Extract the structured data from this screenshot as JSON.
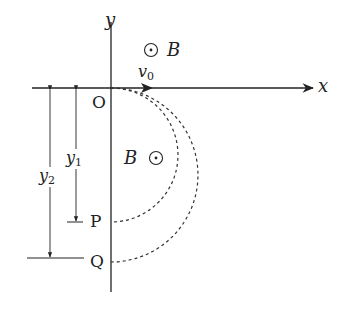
{
  "diagram": {
    "axes": {
      "x_label": "x",
      "y_label": "y",
      "origin_label": "O"
    },
    "velocity": {
      "label": "v",
      "subscript": "0"
    },
    "field": {
      "upper_label": "B",
      "lower_label": "B",
      "direction_symbol": "out-of-page (dot in circle)"
    },
    "points": {
      "p_label": "P",
      "q_label": "Q"
    },
    "dimensions": {
      "y1_label": "y",
      "y1_subscript": "1",
      "y2_label": "y",
      "y2_subscript": "2"
    },
    "trajectories": [
      {
        "name": "inner",
        "from": "O",
        "to": "P",
        "style": "dashed"
      },
      {
        "name": "outer",
        "from": "O",
        "to": "Q",
        "style": "dashed"
      }
    ],
    "colors": {
      "ink": "#222222",
      "background": "#ffffff"
    }
  }
}
